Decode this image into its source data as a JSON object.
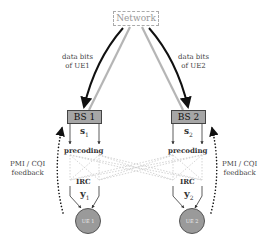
{
  "network": {
    "label": "Network"
  },
  "links": {
    "left_label_line1": "data bits",
    "left_label_line2": "of UE1",
    "right_label_line1": "data bits",
    "right_label_line2": "of UE2"
  },
  "base_stations": [
    {
      "label": "BS 1",
      "signal": "s",
      "signal_sub": "1",
      "precoding": "precoding"
    },
    {
      "label": "BS 2",
      "signal": "s",
      "signal_sub": "2",
      "precoding": "precoding"
    }
  ],
  "receivers": [
    {
      "label": "UE 1",
      "irc": "IRC",
      "received": "y",
      "received_sub": "1"
    },
    {
      "label": "UE 2",
      "irc": "IRC",
      "received": "y",
      "received_sub": "2"
    }
  ],
  "feedback": {
    "left_line1": "PMI / CQI",
    "left_line2": "feedback",
    "right_line1": "PMI / CQI",
    "right_line2": "feedback"
  },
  "colors": {
    "bs_fill": "#a6a6a6",
    "ue_fill": "#9a9a9a",
    "data_arrow": "#111111",
    "return_line": "#b5b5b5",
    "interference": "#d0d0d0"
  }
}
